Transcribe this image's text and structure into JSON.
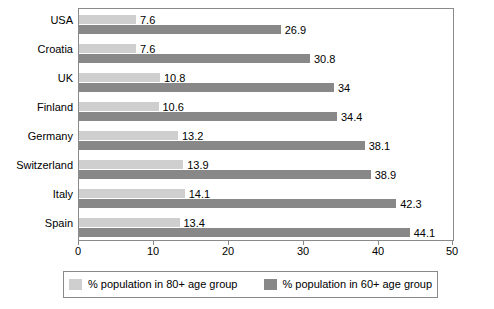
{
  "chart_data": {
    "type": "bar",
    "title": "",
    "xlabel": "",
    "ylabel": "",
    "orientation": "horizontal",
    "xlim": [
      0,
      50
    ],
    "xticks": [
      0,
      10,
      20,
      30,
      40,
      50
    ],
    "grid": false,
    "legend_position": "bottom",
    "categories": [
      "USA",
      "Croatia",
      "UK",
      "Finland",
      "Germany",
      "Switzerland",
      "Italy",
      "Spain"
    ],
    "series": [
      {
        "name": "% population in 80+ age group",
        "color": "#cfcfcf",
        "values": [
          7.6,
          7.6,
          10.8,
          10.6,
          13.2,
          13.9,
          14.1,
          13.4
        ]
      },
      {
        "name": "% population in 60+ age group",
        "color": "#888888",
        "values": [
          26.9,
          30.8,
          34,
          34.4,
          38.1,
          38.9,
          42.3,
          44.1
        ]
      }
    ]
  },
  "legend": {
    "items": [
      {
        "label": "% population in 80+ age group"
      },
      {
        "label": "% population in 60+ age group"
      }
    ]
  }
}
